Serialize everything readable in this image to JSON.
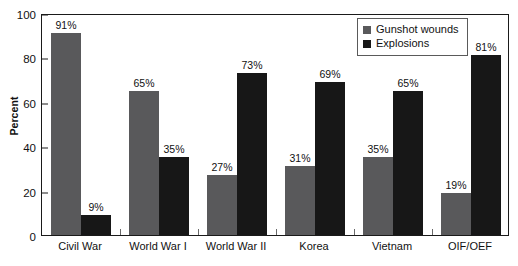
{
  "chart_data": {
    "type": "bar",
    "title": "",
    "xlabel": "",
    "ylabel": "Percent",
    "ylim": [
      0,
      100
    ],
    "yticks": [
      0,
      20,
      40,
      60,
      80,
      100
    ],
    "ytick_labels": [
      "0",
      "20",
      "40",
      "60",
      "80",
      "100"
    ],
    "grid": false,
    "legend_position": "top-right",
    "categories": [
      "Civil War",
      "World War I",
      "World War II",
      "Korea",
      "Vietnam",
      "OIF/OEF"
    ],
    "series": [
      {
        "name": "Gunshot wounds",
        "color": "#59595b",
        "values": [
          91,
          65,
          27,
          31,
          35,
          19
        ],
        "labels": [
          "91%",
          "65%",
          "27%",
          "31%",
          "35%",
          "19%"
        ]
      },
      {
        "name": "Explosions",
        "color": "#171717",
        "values": [
          9,
          35,
          73,
          69,
          65,
          81
        ],
        "labels": [
          "9%",
          "35%",
          "73%",
          "69%",
          "65%",
          "81%"
        ]
      }
    ]
  },
  "legend": {
    "items": [
      {
        "label": "Gunshot wounds",
        "color": "#59595b"
      },
      {
        "label": "Explosions",
        "color": "#171717"
      }
    ]
  },
  "axis": {
    "y_title": "Percent"
  }
}
